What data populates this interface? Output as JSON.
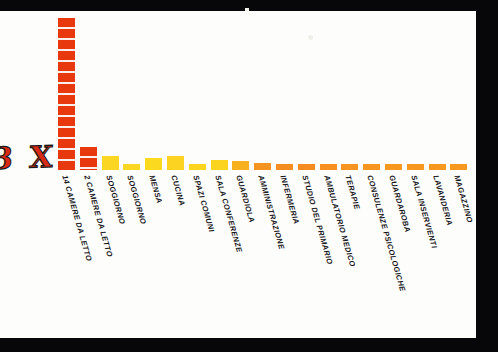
{
  "figure": {
    "annotation_mark": "3 X",
    "background_color": "#fdfdfb",
    "frame_color": "#07070a",
    "annotation_color": "#d92b14"
  },
  "chart_data": {
    "type": "bar",
    "title": "",
    "subtitle": "",
    "xlabel": "",
    "ylabel": "",
    "grid": false,
    "legend": "none",
    "ylim": [
      0,
      14
    ],
    "categories": [
      "14 CAMERE DA LETTO",
      "2 CAMERE DA LETTO",
      "SOGGIORNO",
      "SOGGIORNO",
      "MENSA",
      "CUCINA",
      "SPAZI COMUNI",
      "SALA CONFERENZE",
      "GUARDIOLA",
      "AMMINISTRAZIONE",
      "INFERMERIA",
      "STUDIO DEL PRIMARIO",
      "AMBULATORIO MEDICO",
      "TERAPIE",
      "CONSULENZE PSICOLOGICHE",
      "GUARDAROBA",
      "SALA INSERVIENTI",
      "LAVANDERIA",
      "MAGAZZINO"
    ],
    "values": [
      14,
      2.1,
      1.3,
      0.55,
      1.1,
      1.25,
      0.6,
      0.95,
      0.8,
      0.62,
      0.5,
      0.42,
      0.4,
      0.33,
      0.33,
      0.3,
      0.3,
      0.3,
      0.3
    ],
    "bar_colors": [
      "#e8380d",
      "#e8380d",
      "#fbd724",
      "#fbd724",
      "#fbd91f",
      "#fbd320",
      "#fbd520",
      "#fbd41f",
      "#f8b01f",
      "#f59420",
      "#f58e20",
      "#f58b21",
      "#f79021",
      "#f79421",
      "#f79521",
      "#f79821",
      "#f79821",
      "#f79821",
      "#f79821"
    ],
    "segmented_bars": [
      true,
      true,
      false,
      false,
      false,
      false,
      false,
      false,
      false,
      false,
      false,
      false,
      false,
      false,
      false,
      false,
      false,
      false,
      false
    ]
  }
}
